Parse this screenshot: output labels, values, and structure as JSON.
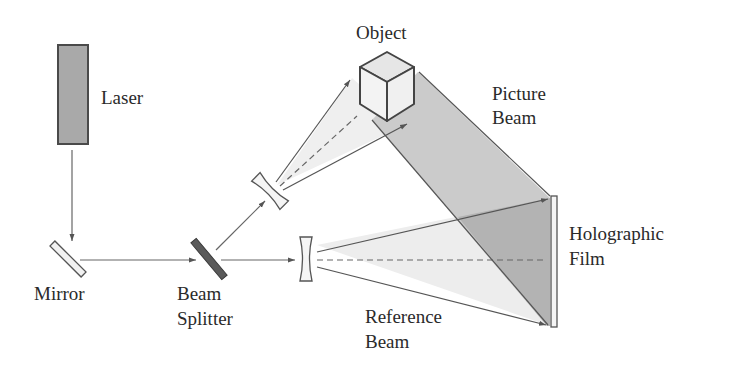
{
  "diagram": {
    "labels": {
      "laser": "Laser",
      "object": "Object",
      "picture_beam_line1": "Picture",
      "picture_beam_line2": "Beam",
      "mirror": "Mirror",
      "beam_splitter_line1": "Beam",
      "beam_splitter_line2": "Splitter",
      "holographic_film_line1": "Holographic",
      "holographic_film_line2": "Film",
      "reference_beam_line1": "Reference",
      "reference_beam_line2": "Beam"
    },
    "components": [
      "laser",
      "mirror",
      "beam-splitter",
      "diverging-lens-upper",
      "diverging-lens-lower",
      "object-cube",
      "holographic-film"
    ],
    "colors": {
      "line": "#555555",
      "laser_fill": "#a9a9a9",
      "splitter_fill": "#5a5a5a",
      "light_cone": "#ececec",
      "picture_beam": "#c9c9c9",
      "overlap": "#b4b4b4"
    }
  }
}
